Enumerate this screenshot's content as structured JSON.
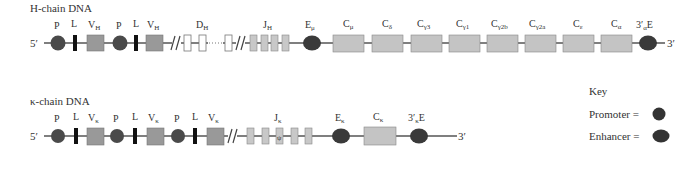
{
  "heavy": {
    "title": "H-chain DNA",
    "five_prime": "5′",
    "three_prime": "3′",
    "labels": {
      "P": "P",
      "L": "L",
      "V": "V",
      "V_sub": "H",
      "D": "D",
      "D_sub": "H",
      "J": "J",
      "J_sub": "H",
      "E": "E",
      "E_sub": "μ",
      "C": "C",
      "C_subs": [
        "μ",
        "δ",
        "γ3",
        "γ1",
        "γ2b",
        "γ2a",
        "ε",
        "α"
      ],
      "E3_pre": "3′",
      "E3_sub": "α",
      "E3_post": "E"
    }
  },
  "kappa": {
    "title": "κ-chain DNA",
    "five_prime": "5′",
    "three_prime": "3′",
    "labels": {
      "P": "P",
      "L": "L",
      "V": "V",
      "V_sub": "κ",
      "J": "J",
      "J_sub": "κ",
      "psi": "ψ",
      "E": "E",
      "E_sub": "κ",
      "C": "C",
      "C_sub": "κ",
      "E3_pre": "3′",
      "E3_sub": "κ",
      "E3_post": "E"
    }
  },
  "key": {
    "title": "Key",
    "promoter": "Promoter =",
    "enhancer": "Enhancer ="
  },
  "colors": {
    "line": "#555555",
    "promoter": "#4a4a4a",
    "enhancer": "#3a3a3a",
    "leader": "#111111",
    "v_segment": "#999999",
    "j_segment": "#c8c8c8",
    "c_segment": "#c4c4c4",
    "d_segment": "#ffffff"
  }
}
